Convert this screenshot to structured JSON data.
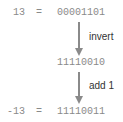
{
  "diagram": {
    "rows": [
      {
        "label": "13",
        "equals": "=",
        "bits": "00001101"
      },
      {
        "label": "",
        "equals": "",
        "bits": "11110010"
      },
      {
        "label": "-13",
        "equals": "=",
        "bits": "11110011"
      }
    ],
    "steps": [
      {
        "label": "invert"
      },
      {
        "label": "add 1"
      }
    ],
    "colors": {
      "text_mono": "#8a8a8a",
      "text_label": "#333333",
      "arrow": "#8a8a8a"
    }
  }
}
